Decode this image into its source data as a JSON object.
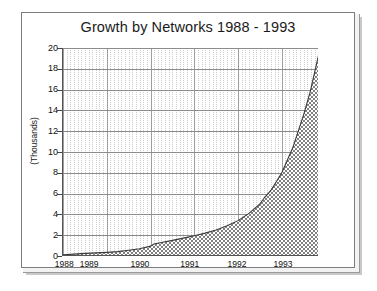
{
  "chart_data": {
    "type": "area",
    "title": "Growth by Networks 1988 - 1993",
    "xlabel": "",
    "ylabel": "(Thousands)",
    "ylim": [
      0,
      20
    ],
    "xlim": [
      1988.0,
      1993.85
    ],
    "y_ticks": [
      0,
      2,
      4,
      6,
      8,
      10,
      12,
      14,
      16,
      18,
      20
    ],
    "y_tick_labels": [
      "0",
      "2",
      "4",
      "6",
      "8",
      "10",
      "12",
      "14",
      "16",
      "18",
      "20"
    ],
    "x_tick_labels": [
      "1988",
      "1989",
      "1990",
      "1991",
      "1992",
      "1993"
    ],
    "x_tick_values": [
      1988.05,
      1988.62,
      1989.78,
      1990.92,
      1992.0,
      1993.05
    ],
    "grid": "both",
    "grid_minor_x": true,
    "legend": "none",
    "fill_pattern": "checkerboard",
    "fill_color": "#8a8a8a",
    "line_color": "#333333",
    "series": [
      {
        "name": "Networks",
        "x": [
          1988.0,
          1988.25,
          1988.5,
          1988.75,
          1989.0,
          1989.25,
          1989.5,
          1989.75,
          1990.0,
          1990.08,
          1990.25,
          1990.5,
          1990.75,
          1991.0,
          1991.25,
          1991.5,
          1991.75,
          1992.0,
          1992.25,
          1992.5,
          1992.6,
          1992.75,
          1993.0,
          1993.25,
          1993.5,
          1993.65,
          1993.85
        ],
        "values": [
          0.12,
          0.18,
          0.25,
          0.3,
          0.35,
          0.42,
          0.55,
          0.7,
          0.95,
          1.15,
          1.3,
          1.5,
          1.72,
          1.95,
          2.2,
          2.5,
          2.9,
          3.4,
          4.1,
          5.0,
          5.6,
          6.3,
          8.0,
          10.4,
          13.6,
          15.8,
          19.5
        ]
      }
    ]
  },
  "figure": {
    "title": "Growth by Networks 1988 - 1993",
    "y_axis_caption": "(Thousands)"
  }
}
